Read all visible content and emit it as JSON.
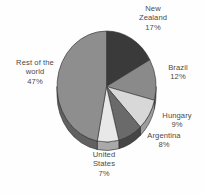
{
  "chart_data": {
    "type": "pie",
    "title": "",
    "subtitle": "",
    "xlabel": "",
    "ylabel": "",
    "legend_position": "none",
    "grid": false,
    "three_d": true,
    "start_angle_deg": 0,
    "direction": "clockwise",
    "categories": [
      "New Zealand",
      "Brazil",
      "Hungary",
      "Argentina",
      "United States",
      "Rest of the world"
    ],
    "values": [
      17,
      12,
      9,
      8,
      7,
      47
    ],
    "value_unit": "%",
    "slices": [
      {
        "label": "New Zealand",
        "name_line1": "New",
        "name_line2": "Zealand",
        "value": 17,
        "value_text": "17%",
        "color": "#3a3a3a",
        "side_color": "#242424"
      },
      {
        "label": "Brazil",
        "name_line1": "Brazil",
        "name_line2": "",
        "value": 12,
        "value_text": "12%",
        "color": "#8a8a8a",
        "side_color": "#5e5e5e"
      },
      {
        "label": "Hungary",
        "name_line1": "Hungary",
        "name_line2": "",
        "value": 9,
        "value_text": "9%",
        "color": "#d8d8d8",
        "side_color": "#9d9d9d"
      },
      {
        "label": "Argentina",
        "name_line1": "Argentina",
        "name_line2": "",
        "value": 8,
        "value_text": "8%",
        "color": "#6a6a6a",
        "side_color": "#464646"
      },
      {
        "label": "United States",
        "name_line1": "United",
        "name_line2": "States",
        "value": 7,
        "value_text": "7%",
        "color": "#e8e8e8",
        "side_color": "#a9a9a9"
      },
      {
        "label": "Rest of the world",
        "name_line1": "Rest of the",
        "name_line2": "world",
        "value": 47,
        "value_text": "47%",
        "color": "#8e8e8e",
        "side_color": "#616161"
      }
    ]
  },
  "labels": {
    "new_zealand": {
      "line1": "New",
      "line2": "Zealand",
      "pct": "17%"
    },
    "brazil": {
      "line1": "Brazil",
      "line2": "",
      "pct": "12%"
    },
    "hungary": {
      "line1": "Hungary",
      "line2": "",
      "pct": "9%"
    },
    "argentina": {
      "line1": "Argentina",
      "line2": "",
      "pct": "8%"
    },
    "united_states": {
      "line1": "United",
      "line2": "States",
      "pct": "7%"
    },
    "rest": {
      "line1": "Rest of the",
      "line2": "world",
      "pct": "47%"
    }
  },
  "colors": {
    "background": "#fefefe",
    "text": "#4a4a4a",
    "outline": "#2b2b2b"
  }
}
